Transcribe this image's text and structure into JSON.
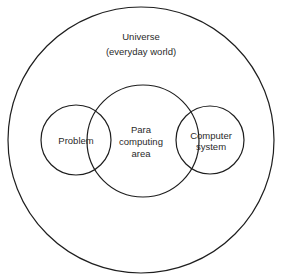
{
  "diagram": {
    "type": "venn",
    "universe": {
      "line1": "Universe",
      "line2": "(everyday world)"
    },
    "problem": {
      "label": "Problem"
    },
    "para_computing": {
      "line1": "Para",
      "line2": "computing",
      "line3": "area"
    },
    "computer_system": {
      "line1": "Computer",
      "line2": "system"
    },
    "colors": {
      "stroke": "#1e1e1e",
      "text": "#2a2a2a",
      "background": "#ffffff"
    }
  }
}
